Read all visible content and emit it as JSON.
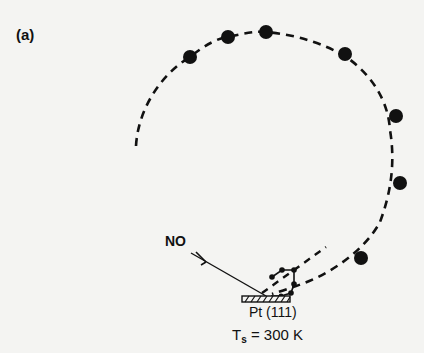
{
  "figure": {
    "panel_label": "(a)",
    "incident_molecule": "NO",
    "surface": "Pt (111)",
    "temperature": {
      "symbol": "T",
      "subscript": "s",
      "relation": "=",
      "value": "300 K"
    },
    "colors": {
      "background": "#f4f4f2",
      "ink": "#111111"
    },
    "trajectory_points": [
      {
        "x": 190,
        "y": 57
      },
      {
        "x": 228,
        "y": 37
      },
      {
        "x": 266,
        "y": 32
      },
      {
        "x": 345,
        "y": 54
      },
      {
        "x": 396,
        "y": 116
      },
      {
        "x": 400,
        "y": 183
      },
      {
        "x": 360,
        "y": 258
      }
    ],
    "adsorbate_points": [
      {
        "x": 272,
        "y": 277
      },
      {
        "x": 282,
        "y": 270
      },
      {
        "x": 294,
        "y": 270
      },
      {
        "x": 294,
        "y": 284
      },
      {
        "x": 291,
        "y": 293
      },
      {
        "x": 281,
        "y": 296
      },
      {
        "x": 271,
        "y": 296
      }
    ]
  }
}
